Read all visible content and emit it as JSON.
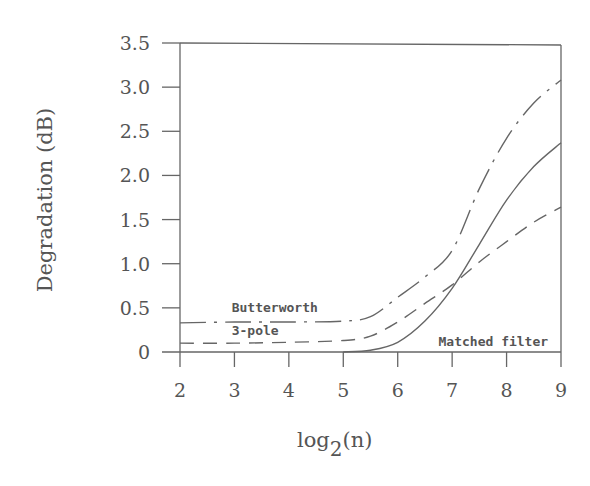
{
  "chart_data": {
    "type": "line",
    "title": "",
    "xlabel": "log2(n)",
    "xlabel_parts": {
      "base": "log",
      "sub": "2",
      "arg": "(n)"
    },
    "ylabel": "Degradation (dB)",
    "xlim": [
      2,
      9
    ],
    "ylim": [
      0,
      3.5
    ],
    "grid": false,
    "legend": "inline annotations",
    "x_ticks": [
      2,
      3,
      4,
      5,
      6,
      7,
      8,
      9
    ],
    "x_tick_labels": [
      "2",
      "3",
      "4",
      "5",
      "6",
      "7",
      "8",
      "9"
    ],
    "y_ticks": [
      0,
      0.5,
      1.0,
      1.5,
      2.0,
      2.5,
      3.0,
      3.5
    ],
    "y_tick_labels": [
      "0",
      "0.5",
      "1.0",
      "1.5",
      "2.0",
      "2.5",
      "3.0",
      "3.5"
    ],
    "series": [
      {
        "name": "Butterworth",
        "style": "long-dash",
        "x": [
          2,
          3,
          4,
          5,
          5.5,
          6,
          6.5,
          7,
          7.5,
          8,
          8.5,
          9
        ],
        "values": [
          0.33,
          0.34,
          0.34,
          0.35,
          0.4,
          0.62,
          0.85,
          1.15,
          1.85,
          2.42,
          2.82,
          3.08
        ]
      },
      {
        "name": "3-pole",
        "style": "short-dash",
        "x": [
          2,
          3,
          4,
          5,
          5.5,
          6,
          6.5,
          7,
          7.5,
          8,
          8.5,
          9
        ],
        "values": [
          0.1,
          0.1,
          0.11,
          0.13,
          0.18,
          0.34,
          0.55,
          0.76,
          1.02,
          1.25,
          1.47,
          1.64
        ]
      },
      {
        "name": "Matched filter",
        "style": "solid",
        "x": [
          5,
          5.5,
          6,
          6.5,
          7,
          7.5,
          8,
          8.5,
          9
        ],
        "values": [
          0.0,
          0.02,
          0.11,
          0.35,
          0.72,
          1.22,
          1.72,
          2.1,
          2.37
        ]
      }
    ],
    "annotations": [
      {
        "text": "Butterworth",
        "x": 2.95,
        "y": 0.45
      },
      {
        "text": "3-pole",
        "x": 2.95,
        "y": 0.19
      },
      {
        "text": "Matched filter",
        "x": 6.75,
        "y": 0.07
      }
    ]
  }
}
